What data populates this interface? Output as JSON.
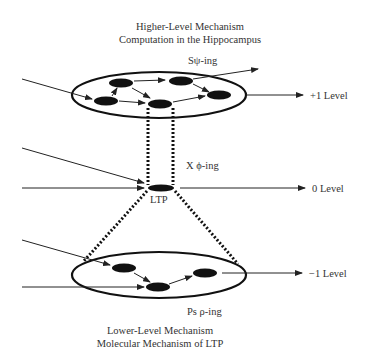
{
  "diagram": {
    "top": {
      "title_line1": "Higher-Level Mechanism",
      "title_line2": "Computation in the Hippocampus",
      "process_label": "Sψ-ing",
      "level_label": "+1 Level"
    },
    "middle": {
      "process_label": "X ϕ-ing",
      "node_label": "LTP",
      "level_label": "0 Level"
    },
    "bottom": {
      "process_label": "Ps ρ-ing",
      "level_label": "−1 Level",
      "title_line1": "Lower-Level Mechanism",
      "title_line2": "Molecular Mechanism of LTP"
    },
    "colors": {
      "stroke": "#111111",
      "text": "#333333",
      "background": "#ffffff"
    }
  }
}
